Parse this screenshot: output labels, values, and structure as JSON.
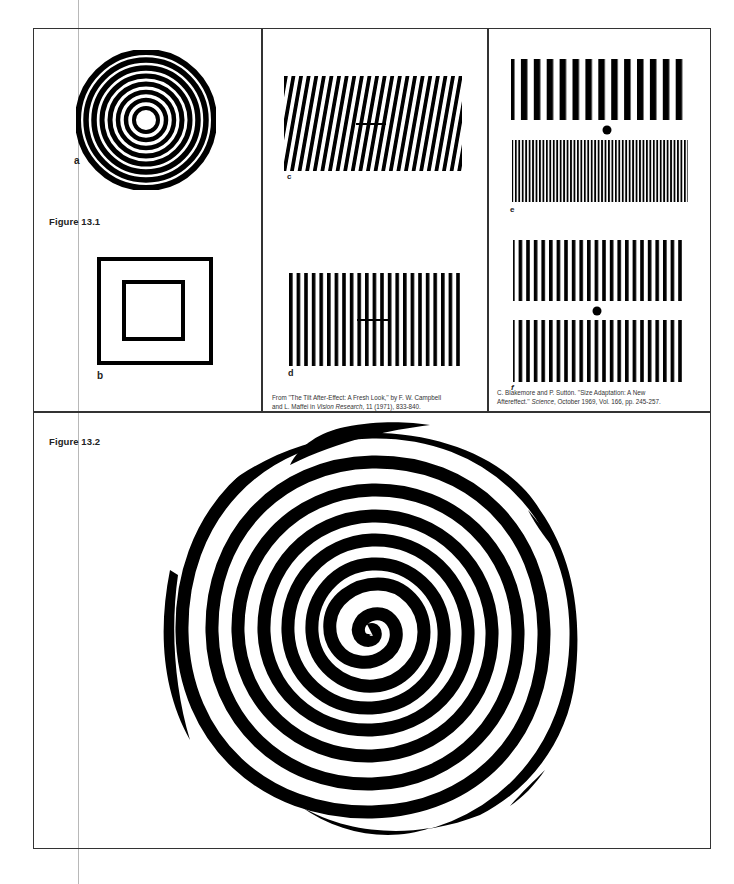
{
  "page": {
    "figures": [
      {
        "label": "Figure 13.1"
      },
      {
        "label": "Figure 13.2"
      }
    ],
    "panels": {
      "a": {
        "letter": "a",
        "type": "concentric-rings"
      },
      "b": {
        "letter": "b",
        "type": "nested-squares"
      },
      "c": {
        "letter": "c",
        "type": "tilted-grating-with-bar"
      },
      "d": {
        "letter": "d",
        "type": "vertical-grating-with-bar"
      },
      "e": {
        "letter": "e",
        "type": "coarse-over-fine-grating-with-dot"
      },
      "f": {
        "letter": "f",
        "type": "medium-gratings-with-dot"
      }
    },
    "captions": {
      "campbell": {
        "line1": "From ''The Tilt After-Effect: A Fresh Look,'' by F. W. Campbell",
        "line2_pre": "and L. Maffei in ",
        "line2_italic": "Vision Research",
        "line2_post": ", 11 (1971), 833-840."
      },
      "blakemore": {
        "line1": "C. Blakemore and P. Suttón. ''Size Adaptation: A New",
        "line2_pre": "Aftereffect.'' ",
        "line2_italic": "Science",
        "line2_post": ", October 1969, Vol. 166, pp. 245-257."
      }
    },
    "colors": {
      "ink": "#000000",
      "paper": "#ffffff",
      "rule": "#333333"
    }
  }
}
